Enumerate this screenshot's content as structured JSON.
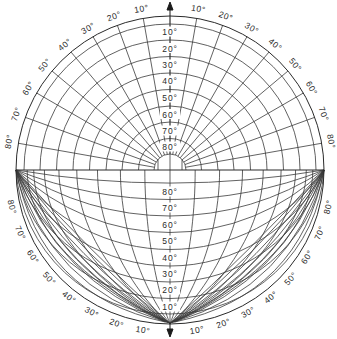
{
  "diagram": {
    "center": [
      170,
      170
    ],
    "outer_radius": 154,
    "inner_radius": 16,
    "bottom_vertex": [
      170,
      323
    ],
    "line_color": "#3a3a3a",
    "background": "#ffffff",
    "upper_rings_radii": [
      146,
      130,
      113.5,
      97,
      80.5,
      64,
      48,
      31.5
    ],
    "upper_axis_labels": [
      {
        "text": "10°",
        "y": 32
      },
      {
        "text": "20°",
        "y": 48.5
      },
      {
        "text": "30°",
        "y": 65
      },
      {
        "text": "40°",
        "y": 81
      },
      {
        "text": "50°",
        "y": 98
      },
      {
        "text": "60°",
        "y": 114.5
      },
      {
        "text": "70°",
        "y": 131
      },
      {
        "text": "80°",
        "y": 147
      }
    ],
    "lower_axis_labels": [
      {
        "text": "80°",
        "y": 192
      },
      {
        "text": "70°",
        "y": 208
      },
      {
        "text": "60°",
        "y": 224.5
      },
      {
        "text": "50°",
        "y": 241
      },
      {
        "text": "40°",
        "y": 258
      },
      {
        "text": "30°",
        "y": 274
      },
      {
        "text": "20°",
        "y": 290
      },
      {
        "text": "10°",
        "y": 307
      }
    ],
    "lower_parallels_axis_y": [
      183,
      199.5,
      216,
      232.5,
      249.5,
      266,
      282,
      298.5,
      314
    ],
    "meridian_angles_deg": [
      10,
      20,
      30,
      40,
      50,
      60,
      70,
      80
    ],
    "upper_rim_labels_left": [
      "10°",
      "20°",
      "30°",
      "40°",
      "50°",
      "60°",
      "70°",
      "80°"
    ],
    "upper_rim_labels_right": [
      "10°",
      "20°",
      "30°",
      "40°",
      "50°",
      "60°",
      "70°",
      "80°"
    ],
    "lower_rim_labels_left": [
      "10°",
      "20°",
      "30°",
      "40°",
      "50°",
      "60°",
      "70°",
      "80°"
    ],
    "lower_rim_labels_right": [
      "10°",
      "20°",
      "30°",
      "40°",
      "50°",
      "60°",
      "70°",
      "80°"
    ],
    "arrows": {
      "top": "north-arrow",
      "bottom": "south-arrow"
    }
  }
}
